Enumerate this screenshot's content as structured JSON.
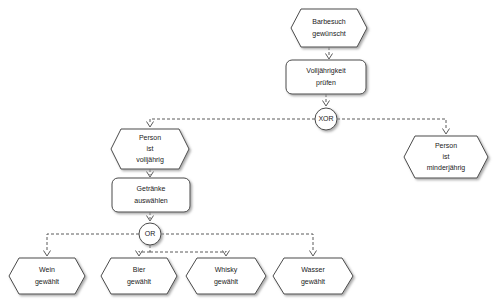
{
  "diagram": {
    "type": "epc",
    "background_color": "#ffffff",
    "shape_stroke_color": "#4a4a4a",
    "shape_fill_color": "#ffffff",
    "line_color": "#5a5a5a",
    "text_color": "#1a1a1a",
    "nodes": [
      {
        "id": "ev-barbesuch",
        "kind": "event",
        "shape": "hexagon",
        "lines": [
          "Barbesuch",
          "gewünscht"
        ],
        "x": 291,
        "y": 9,
        "w": 76,
        "h": 38
      },
      {
        "id": "fn-volljaehrigkeit",
        "kind": "function",
        "shape": "rounded-rect",
        "lines": [
          "Volljährigkeit",
          "prüfen"
        ],
        "x": 286,
        "y": 60,
        "w": 80,
        "h": 34
      },
      {
        "id": "cn-xor",
        "kind": "connector",
        "shape": "circle",
        "label": "XOR",
        "cx": 326,
        "cy": 119,
        "r": 11
      },
      {
        "id": "ev-volljaehrig",
        "kind": "event",
        "shape": "hexagon",
        "lines": [
          "Person",
          "ist",
          "volljährig"
        ],
        "x": 111,
        "y": 129,
        "w": 78,
        "h": 40
      },
      {
        "id": "ev-minderjaehrig",
        "kind": "event",
        "shape": "hexagon",
        "lines": [
          "Person",
          "ist",
          "minderjährig"
        ],
        "x": 404,
        "y": 136,
        "w": 84,
        "h": 42
      },
      {
        "id": "fn-getraenke",
        "kind": "function",
        "shape": "rounded-rect",
        "lines": [
          "Getränke",
          "auswählen"
        ],
        "x": 112,
        "y": 178,
        "w": 78,
        "h": 34
      },
      {
        "id": "cn-or",
        "kind": "connector",
        "shape": "circle",
        "label": "OR",
        "cx": 150,
        "cy": 234,
        "r": 11
      },
      {
        "id": "ev-wein",
        "kind": "event",
        "shape": "hexagon",
        "lines": [
          "Wein",
          "gewählt"
        ],
        "x": 9,
        "y": 258,
        "w": 76,
        "h": 36
      },
      {
        "id": "ev-bier",
        "kind": "event",
        "shape": "hexagon",
        "lines": [
          "Bier",
          "gewählt"
        ],
        "x": 101,
        "y": 258,
        "w": 76,
        "h": 36
      },
      {
        "id": "ev-whisky",
        "kind": "event",
        "shape": "hexagon",
        "lines": [
          "Whisky",
          "gewählt"
        ],
        "x": 186,
        "y": 258,
        "w": 80,
        "h": 36
      },
      {
        "id": "ev-wasser",
        "kind": "event",
        "shape": "hexagon",
        "lines": [
          "Wasser",
          "gewählt"
        ],
        "x": 273,
        "y": 258,
        "w": 80,
        "h": 36
      }
    ],
    "edges": [
      {
        "id": "e1",
        "from": "ev-barbesuch",
        "to": "fn-volljaehrigkeit"
      },
      {
        "id": "e2",
        "from": "fn-volljaehrigkeit",
        "to": "cn-xor"
      },
      {
        "id": "e3",
        "from": "cn-xor",
        "to": "ev-volljaehrig"
      },
      {
        "id": "e4",
        "from": "cn-xor",
        "to": "ev-minderjaehrig"
      },
      {
        "id": "e5",
        "from": "ev-volljaehrig",
        "to": "fn-getraenke"
      },
      {
        "id": "e6",
        "from": "fn-getraenke",
        "to": "cn-or"
      },
      {
        "id": "e7",
        "from": "cn-or",
        "to": "ev-wein"
      },
      {
        "id": "e8",
        "from": "cn-or",
        "to": "ev-bier"
      },
      {
        "id": "e9",
        "from": "cn-or",
        "to": "ev-whisky"
      },
      {
        "id": "e10",
        "from": "cn-or",
        "to": "ev-wasser"
      }
    ]
  }
}
